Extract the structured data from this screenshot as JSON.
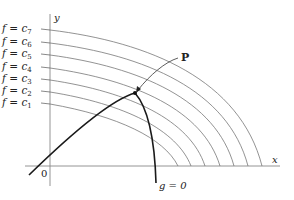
{
  "diagram": {
    "title": "",
    "axes": {
      "x_label": "x",
      "y_label": "y",
      "origin_label": "0"
    },
    "level_curves": [
      {
        "label": "f = c7",
        "f": "f",
        "sub": "7",
        "y": 29
      },
      {
        "label": "f = c6",
        "f": "f",
        "sub": "6",
        "y": 42
      },
      {
        "label": "f = c5",
        "f": "f",
        "sub": "5",
        "y": 54
      },
      {
        "label": "f = c4",
        "f": "f",
        "sub": "4",
        "y": 67
      },
      {
        "label": "f = c3",
        "f": "f",
        "sub": "3",
        "y": 79
      },
      {
        "label": "f = c2",
        "f": "f",
        "sub": "2",
        "y": 91
      },
      {
        "label": "f = c1",
        "f": "f",
        "sub": "1",
        "y": 103
      }
    ],
    "constraint_label": "g = 0",
    "point_label": "P",
    "colors": {
      "level_curve": "#777777",
      "constraint": "#1a1a1a",
      "axis": "#888888",
      "text": "#222222"
    }
  }
}
